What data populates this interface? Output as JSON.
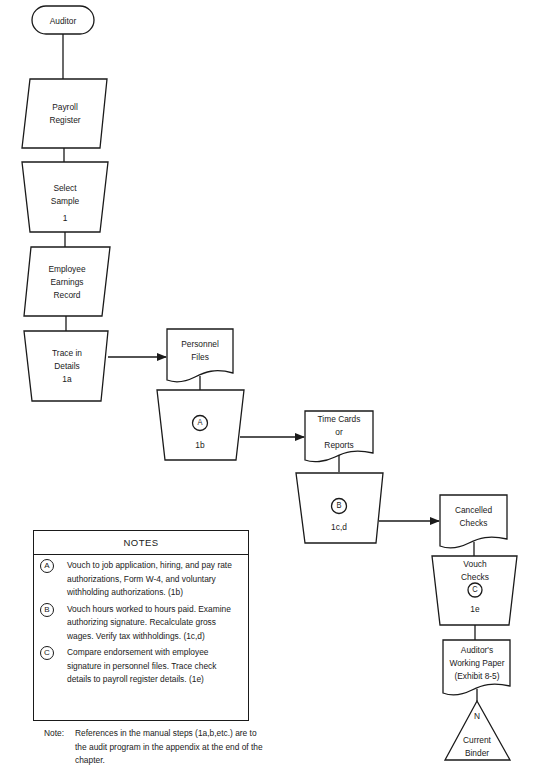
{
  "flowchart": {
    "nodes": {
      "auditor": {
        "label": "Auditor",
        "shape": "terminal"
      },
      "payroll_register": {
        "line1": "Payroll",
        "line2": "Register",
        "shape": "input-parallelogram"
      },
      "select_sample": {
        "line1": "Select",
        "line2": "Sample",
        "ref": "1",
        "shape": "manual-operation"
      },
      "employee_earnings": {
        "line1": "Employee",
        "line2": "Earnings",
        "line3": "Record",
        "shape": "input-parallelogram"
      },
      "trace_details": {
        "line1": "Trace in",
        "line2": "Details",
        "ref": "1a",
        "shape": "manual-operation"
      },
      "personnel_files": {
        "line1": "Personnel",
        "line2": "Files",
        "shape": "document"
      },
      "step_a": {
        "marker": "A",
        "ref": "1b",
        "shape": "manual-operation"
      },
      "time_cards": {
        "line1": "Time Cards",
        "line2": "or",
        "line3": "Reports",
        "shape": "document"
      },
      "step_b": {
        "marker": "B",
        "ref": "1c,d",
        "shape": "manual-operation"
      },
      "cancelled_checks": {
        "line1": "Cancelled",
        "line2": "Checks",
        "shape": "document"
      },
      "vouch_checks": {
        "line1": "Vouch",
        "line2": "Checks",
        "marker": "C",
        "ref": "1e",
        "shape": "manual-operation"
      },
      "working_paper": {
        "line1": "Auditor's",
        "line2": "Working Paper",
        "line3": "(Exhibit 8-5)",
        "shape": "document"
      },
      "current_binder": {
        "marker": "N",
        "line1": "Current",
        "line2": "Binder",
        "shape": "offline-storage"
      }
    }
  },
  "notes": {
    "title": "NOTES",
    "items": [
      {
        "marker": "A",
        "text": "Vouch to job application, hiring, and pay rate authorizations, Form W-4, and voluntary withholding authorizations. (1b)"
      },
      {
        "marker": "B",
        "text": "Vouch hours worked to hours paid. Examine authorizing signature. Recalculate gross wages. Verify tax withholdings. (1c,d)"
      },
      {
        "marker": "C",
        "text": "Compare endorsement with employee signature in personnel files. Trace check details to payroll register details. (1e)"
      }
    ]
  },
  "footnote": {
    "label": "Note:",
    "text": "References in the manual steps (1a,b,etc.) are to the audit program in the appendix at the end of the chapter."
  },
  "colors": {
    "stroke": "#1a1a1a",
    "background": "#ffffff"
  }
}
